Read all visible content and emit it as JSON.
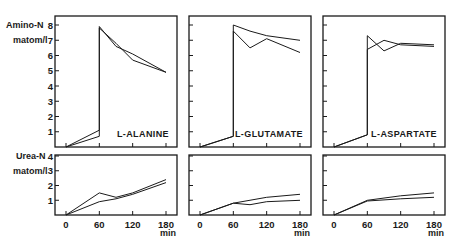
{
  "figure": {
    "top_ylabel_line1": "Amino-N",
    "top_ylabel_line2": "matom/l",
    "bottom_ylabel_line1": "Urea-N",
    "bottom_ylabel_line2": "matom/l",
    "x_unit": "min",
    "caption_partial": ""
  },
  "chart_data": [
    {
      "type": "line",
      "title": "L-ALANINE",
      "panel": "top-left",
      "ylabel": "Amino-N matom/l",
      "xlabel": "min",
      "xlim": [
        0,
        180
      ],
      "ylim": [
        0,
        8
      ],
      "yticks": [
        1,
        2,
        3,
        4,
        5,
        6,
        7,
        8
      ],
      "xticks": [
        0,
        60,
        120,
        180
      ],
      "series": [
        {
          "name": "a",
          "x": [
            0,
            60,
            60,
            90,
            120,
            180
          ],
          "y": [
            0,
            1.1,
            7.9,
            6.6,
            6.1,
            4.9
          ]
        },
        {
          "name": "b",
          "x": [
            0,
            60,
            60,
            90,
            120,
            180
          ],
          "y": [
            0,
            0.7,
            7.8,
            6.8,
            5.7,
            4.9
          ]
        }
      ]
    },
    {
      "type": "line",
      "title": "L-GLUTAMATE",
      "panel": "top-middle",
      "xlim": [
        0,
        180
      ],
      "ylim": [
        0,
        8
      ],
      "yticks": [
        1,
        2,
        3,
        4,
        5,
        6,
        7,
        8
      ],
      "xticks": [
        0,
        60,
        120,
        180
      ],
      "series": [
        {
          "name": "a",
          "x": [
            0,
            60,
            60,
            90,
            120,
            180
          ],
          "y": [
            0,
            0.7,
            8.0,
            7.6,
            7.3,
            7.0
          ]
        },
        {
          "name": "b",
          "x": [
            0,
            60,
            60,
            90,
            120,
            180
          ],
          "y": [
            0,
            0.7,
            7.6,
            6.5,
            7.1,
            6.2
          ]
        }
      ]
    },
    {
      "type": "line",
      "title": "L-ASPARTATE",
      "panel": "top-right",
      "xlim": [
        0,
        180
      ],
      "ylim": [
        0,
        8
      ],
      "yticks": [
        1,
        2,
        3,
        4,
        5,
        6,
        7,
        8
      ],
      "xticks": [
        0,
        60,
        120,
        180
      ],
      "series": [
        {
          "name": "a",
          "x": [
            0,
            60,
            60,
            90,
            120,
            180
          ],
          "y": [
            0,
            0.8,
            7.3,
            6.3,
            6.8,
            6.7
          ]
        },
        {
          "name": "b",
          "x": [
            0,
            60,
            60,
            90,
            120,
            180
          ],
          "y": [
            0,
            0.8,
            6.4,
            7.0,
            6.7,
            6.6
          ]
        }
      ]
    },
    {
      "type": "line",
      "title": "L-ALANINE urea",
      "panel": "bottom-left",
      "ylabel": "Urea-N matom/l",
      "xlabel": "min",
      "xlim": [
        0,
        180
      ],
      "ylim": [
        0,
        4
      ],
      "yticks": [
        1,
        2,
        3,
        4
      ],
      "xticks": [
        0,
        60,
        120,
        180
      ],
      "xticklabels": [
        "0",
        "60",
        "120",
        "180"
      ],
      "series": [
        {
          "name": "a",
          "x": [
            0,
            60,
            90,
            120,
            180
          ],
          "y": [
            0,
            1.5,
            1.2,
            1.5,
            2.4
          ]
        },
        {
          "name": "b",
          "x": [
            0,
            60,
            90,
            120,
            180
          ],
          "y": [
            0,
            0.9,
            1.1,
            1.4,
            2.2
          ]
        }
      ]
    },
    {
      "type": "line",
      "title": "L-GLUTAMATE urea",
      "panel": "bottom-middle",
      "xlim": [
        0,
        180
      ],
      "ylim": [
        0,
        4
      ],
      "yticks": [
        1,
        2,
        3,
        4
      ],
      "xticks": [
        0,
        60,
        120,
        180
      ],
      "xticklabels": [
        "0",
        "60",
        "120",
        "180"
      ],
      "series": [
        {
          "name": "a",
          "x": [
            0,
            60,
            120,
            180
          ],
          "y": [
            0,
            0.8,
            1.2,
            1.4
          ]
        },
        {
          "name": "b",
          "x": [
            0,
            60,
            90,
            120,
            180
          ],
          "y": [
            0,
            0.8,
            0.7,
            0.9,
            1.0
          ]
        }
      ]
    },
    {
      "type": "line",
      "title": "L-ASPARTATE urea",
      "panel": "bottom-right",
      "xlim": [
        0,
        180
      ],
      "ylim": [
        0,
        4
      ],
      "yticks": [
        1,
        2,
        3,
        4
      ],
      "xticks": [
        0,
        60,
        120,
        180
      ],
      "xticklabels": [
        "0",
        "60",
        "120",
        "180"
      ],
      "series": [
        {
          "name": "a",
          "x": [
            0,
            60,
            120,
            180
          ],
          "y": [
            0,
            1.0,
            1.3,
            1.5
          ]
        },
        {
          "name": "b",
          "x": [
            0,
            60,
            120,
            180
          ],
          "y": [
            0,
            0.95,
            1.1,
            1.2
          ]
        }
      ]
    }
  ]
}
